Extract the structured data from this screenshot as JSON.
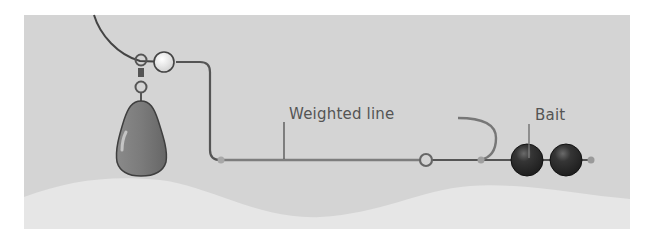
{
  "diagram": {
    "labels": {
      "weighted_line": "Weighted line",
      "bait": "Bait"
    },
    "components": [
      "main-line",
      "bead",
      "swivel",
      "sinker-weight",
      "weighted-line",
      "connector-ring",
      "hook",
      "bait-balls",
      "seabed"
    ],
    "colors": {
      "background": "#d4d4d4",
      "seabed": "#e6e6e6",
      "line": "#5a5a5a",
      "sinker": "#7a7a7a",
      "bait": "#2e2e2e",
      "bead": "#f2f2f2",
      "label": "#555555"
    }
  }
}
